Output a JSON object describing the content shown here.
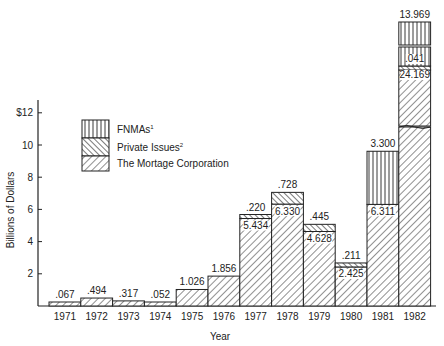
{
  "chart_data": {
    "type": "bar",
    "stacked": true,
    "title": "",
    "xlabel": "Year",
    "ylabel": "Billions of Dollars",
    "ylim": [
      0,
      14
    ],
    "yticks": [
      {
        "value": 2,
        "label": "2"
      },
      {
        "value": 4,
        "label": "4"
      },
      {
        "value": 6,
        "label": "6"
      },
      {
        "value": 8,
        "label": "8"
      },
      {
        "value": 10,
        "label": "10"
      },
      {
        "value": 12,
        "label": "$12"
      }
    ],
    "grid": false,
    "legend_position": "upper-left inside plot",
    "categories": [
      "1971",
      "1972",
      "1973",
      "1974",
      "1975",
      "1976",
      "1977",
      "1978",
      "1979",
      "1980",
      "1981",
      "1982"
    ],
    "series": [
      {
        "name": "The Mortage Corporation",
        "pattern": "diagonal-forward",
        "values": [
          0.067,
          0.494,
          0.317,
          0.052,
          1.026,
          1.856,
          5.434,
          6.33,
          4.628,
          2.425,
          6.311,
          24.169
        ]
      },
      {
        "name": "Private Issues",
        "superscript": "2",
        "pattern": "diagonal-back",
        "values": [
          0,
          0,
          0,
          0,
          0,
          0,
          0.22,
          0.728,
          0.445,
          0.211,
          0,
          0.041
        ]
      },
      {
        "name": "FNMAs",
        "superscript": "1",
        "pattern": "vertical",
        "values": [
          0,
          0,
          0,
          0,
          0,
          0,
          0,
          0,
          0,
          0,
          3.3,
          13.969
        ]
      }
    ],
    "annotations": [
      {
        "category": "1971",
        "labels": [
          ".067"
        ]
      },
      {
        "category": "1972",
        "labels": [
          ".494"
        ]
      },
      {
        "category": "1973",
        "labels": [
          ".317"
        ]
      },
      {
        "category": "1974",
        "labels": [
          ".052"
        ]
      },
      {
        "category": "1975",
        "labels": [
          "1.026"
        ]
      },
      {
        "category": "1976",
        "labels": [
          "1.856"
        ]
      },
      {
        "category": "1977",
        "labels": [
          "5.434",
          ".220"
        ]
      },
      {
        "category": "1978",
        "labels": [
          "6.330",
          ".728"
        ]
      },
      {
        "category": "1979",
        "labels": [
          "4.628",
          ".445"
        ]
      },
      {
        "category": "1980",
        "labels": [
          "2.425",
          ".211"
        ]
      },
      {
        "category": "1981",
        "labels": [
          "6.311",
          "3.300"
        ]
      },
      {
        "category": "1982",
        "labels": [
          "24.169",
          ".041",
          "13.969"
        ],
        "note": "broken scale bar"
      }
    ]
  },
  "legend": {
    "items": [
      {
        "label": "FNMAs",
        "sup": "1",
        "pattern": "vertical"
      },
      {
        "label": "Private Issues",
        "sup": "2",
        "pattern": "diagonal-back"
      },
      {
        "label": "The Mortage Corporation",
        "sup": "",
        "pattern": "diagonal-forward"
      }
    ]
  },
  "axes": {
    "x_title": "Year",
    "y_title": "Billions of Dollars"
  }
}
